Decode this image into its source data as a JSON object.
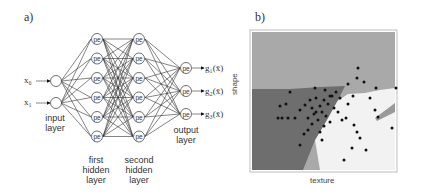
{
  "panel_a": {
    "label": "a)",
    "inputs": [
      "x₀",
      "x₁"
    ],
    "node_text": "pe",
    "outputs": [
      "g₁(x̄)",
      "g₂(x̄)",
      "g₃(x̄)"
    ],
    "layers": {
      "input": {
        "label_line1": "input",
        "label_line2": "layer",
        "count": 2
      },
      "hidden1": {
        "label_line1": "first",
        "label_line2": "hidden",
        "label_line3": "layer",
        "count": 6
      },
      "hidden2": {
        "label_line1": "second",
        "label_line2": "hidden",
        "label_line3": "layer",
        "count": 6
      },
      "output": {
        "label_line1": "output",
        "label_line2": "layer",
        "count": 3
      }
    }
  },
  "panel_b": {
    "label": "b)",
    "xlabel": "texture",
    "ylabel": "shape",
    "colors": {
      "region_top": "#a9a9a9",
      "region_left": "#6e6e6e",
      "region_right": "#f2f2f2",
      "region_wedge": "#9a9a9a",
      "points": "#111111",
      "frame": "#bdbdbd"
    }
  }
}
